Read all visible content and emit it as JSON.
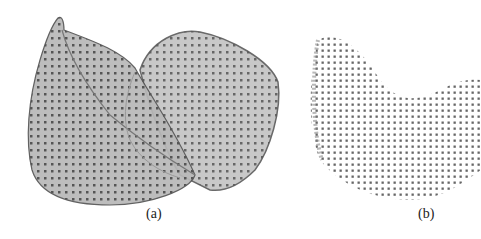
{
  "figure": {
    "panels": [
      {
        "id": "a",
        "caption": "(a)",
        "content": "point cloud with translucent fitted surface, two-lobed shell shape"
      },
      {
        "id": "b",
        "caption": "(b)",
        "content": "point cloud only, curved saddle-like shape"
      }
    ]
  }
}
